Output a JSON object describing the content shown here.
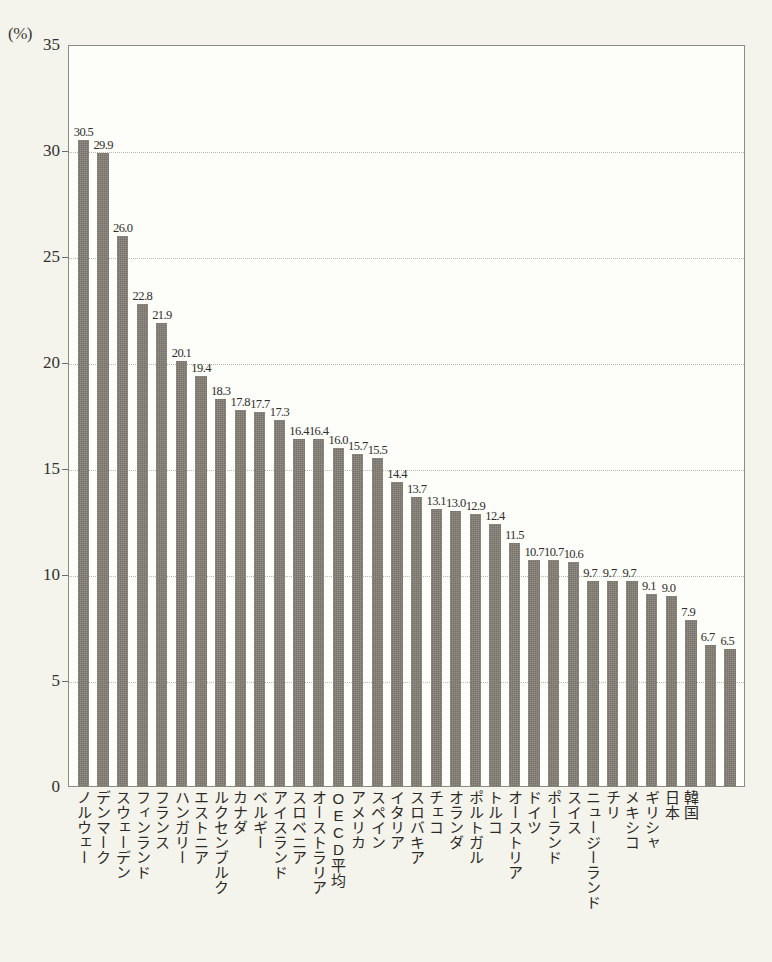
{
  "chart_data": {
    "type": "bar",
    "title": "",
    "subtitle": "",
    "xlabel": "",
    "ylabel": "",
    "unit_label": "(%)",
    "ylim": [
      0,
      35
    ],
    "yticks": [
      0,
      5,
      10,
      15,
      20,
      25,
      30,
      35
    ],
    "ytick_labels": [
      "0",
      "5",
      "10",
      "15",
      "20",
      "25",
      "30",
      "35"
    ],
    "grid": true,
    "legend": "none",
    "bar_color": "#767269",
    "categories": [
      "ノルウェー",
      "デンマーク",
      "スウェーデン",
      "フィンランド",
      "フランス",
      "ハンガリー",
      "エストニア",
      "ルクセンブルク",
      "カナダ",
      "ベルギー",
      "アイスランド",
      "スロベニア",
      "オーストラリア",
      "OECD平均",
      "アメリカ",
      "イタリア",
      "スペイン",
      "スロバキア",
      "チェコ",
      "オランダ",
      "ポルトガル",
      "トルコ",
      "オーストリア",
      "ドイツ",
      "ポーランド",
      "スイス",
      "ニュージーランド",
      "チリ",
      "メキシコ",
      "ギリシャ",
      "日本",
      "韓国"
    ],
    "values": [
      30.5,
      29.9,
      26.0,
      22.8,
      21.9,
      20.1,
      19.4,
      18.3,
      17.8,
      17.7,
      17.3,
      16.4,
      16.4,
      16.0,
      15.7,
      15.5,
      14.4,
      13.7,
      13.1,
      13.0,
      12.9,
      12.4,
      11.5,
      10.7,
      10.7,
      10.6,
      9.7,
      9.7,
      9.7,
      9.1,
      9.0,
      7.9
    ],
    "value_labels": [
      "30.5",
      "29.9",
      "26.0",
      "22.8",
      "21.9",
      "20.1",
      "19.4",
      "18.3",
      "17.8",
      "17.7",
      "17.3",
      "16.4",
      "16.4",
      "16.0",
      "15.7",
      "15.5",
      "14.4",
      "13.7",
      "13.1",
      "13.0",
      "12.9",
      "12.4",
      "11.5",
      "10.7",
      "10.7",
      "10.6",
      "9.7",
      "9.7",
      "9.7",
      "9.1",
      "9.0",
      "7.9"
    ],
    "extra_tail": {
      "categories": [
        "6.7",
        "6.5"
      ],
      "note": "see full_series"
    },
    "full_series": {
      "categories": [
        "ノルウェー",
        "デンマーク",
        "スウェーデン",
        "フィンランド",
        "フランス",
        "ハンガリー",
        "エストニア",
        "ルクセンブルク",
        "カナダ",
        "ベルギー",
        "アイスランド",
        "スロベニア",
        "オーストラリア",
        "OECD平均",
        "アメリカ",
        "イタリア",
        "スペイン",
        "スロバキア",
        "チェコ",
        "オランダ",
        "ポルトガル",
        "トルコ",
        "オーストリア",
        "ドイツ",
        "ポーランド",
        "スイス",
        "ニュージーランド",
        "チリ",
        "メキシコ",
        "ギリシャ",
        "日本",
        "韓国"
      ],
      "values": [
        30.5,
        29.9,
        26.0,
        22.8,
        21.9,
        20.1,
        19.4,
        18.3,
        17.8,
        17.7,
        17.3,
        16.4,
        16.4,
        16.0,
        15.7,
        15.5,
        14.4,
        13.7,
        13.1,
        13.0,
        12.9,
        12.4,
        11.5,
        10.7,
        10.7,
        10.6,
        9.7,
        9.7,
        9.7,
        9.1,
        9.0,
        7.9
      ]
    },
    "bars": [
      {
        "label": "ノルウェー",
        "value": 30.5,
        "value_text": "30.5"
      },
      {
        "label": "デンマーク",
        "value": 29.9,
        "value_text": "29.9"
      },
      {
        "label": "スウェーデン",
        "value": 26.0,
        "value_text": "26.0"
      },
      {
        "label": "フィンランド",
        "value": 22.8,
        "value_text": "22.8"
      },
      {
        "label": "フランス",
        "value": 21.9,
        "value_text": "21.9"
      },
      {
        "label": "ハンガリー",
        "value": 20.1,
        "value_text": "20.1"
      },
      {
        "label": "エストニア",
        "value": 19.4,
        "value_text": "19.4"
      },
      {
        "label": "ルクセンブルク",
        "value": 18.3,
        "value_text": "18.3"
      },
      {
        "label": "カナダ",
        "value": 17.8,
        "value_text": "17.8"
      },
      {
        "label": "ベルギー",
        "value": 17.7,
        "value_text": "17.7"
      },
      {
        "label": "アイスランド",
        "value": 17.3,
        "value_text": "17.3"
      },
      {
        "label": "スロベニア",
        "value": 16.4,
        "value_text": "16.4"
      },
      {
        "label": "オーストラリア",
        "value": 16.4,
        "value_text": "16.4"
      },
      {
        "label": "OECD平均",
        "value": 16.0,
        "value_text": "16.0"
      },
      {
        "label": "アメリカ",
        "value": 15.7,
        "value_text": "15.7"
      },
      {
        "label": "スペイン",
        "value": 15.5,
        "value_text": "15.5"
      },
      {
        "label": "イタリア",
        "value": 14.4,
        "value_text": "14.4"
      },
      {
        "label": "スロバキア",
        "value": 13.7,
        "value_text": "13.7"
      },
      {
        "label": "チェコ",
        "value": 13.1,
        "value_text": "13.1"
      },
      {
        "label": "オランダ",
        "value": 13.0,
        "value_text": "13.0"
      },
      {
        "label": "ポルトガル",
        "value": 12.9,
        "value_text": "12.9"
      },
      {
        "label": "トルコ",
        "value": 12.4,
        "value_text": "12.4"
      },
      {
        "label": "オーストリア",
        "value": 11.5,
        "value_text": "11.5"
      },
      {
        "label": "ドイツ",
        "value": 10.7,
        "value_text": "10.7"
      },
      {
        "label": "ポーランド",
        "value": 10.7,
        "value_text": "10.7"
      },
      {
        "label": "スイス",
        "value": 10.6,
        "value_text": "10.6"
      },
      {
        "label": "ニュージーランド",
        "value": 9.7,
        "value_text": "9.7"
      },
      {
        "label": "チリ",
        "value": 9.7,
        "value_text": "9.7"
      },
      {
        "label": "メキシコ",
        "value": 9.7,
        "value_text": "9.7"
      },
      {
        "label": "ギリシャ",
        "value": 9.1,
        "value_text": "9.1"
      },
      {
        "label": "日本",
        "value": 9.0,
        "value_text": "9.0"
      },
      {
        "label": "韓国",
        "value": 7.9,
        "value_text": "7.9"
      },
      {
        "label": "",
        "value": 6.7,
        "value_text": "6.7"
      },
      {
        "label": "",
        "value": 6.5,
        "value_text": "6.5"
      }
    ]
  }
}
